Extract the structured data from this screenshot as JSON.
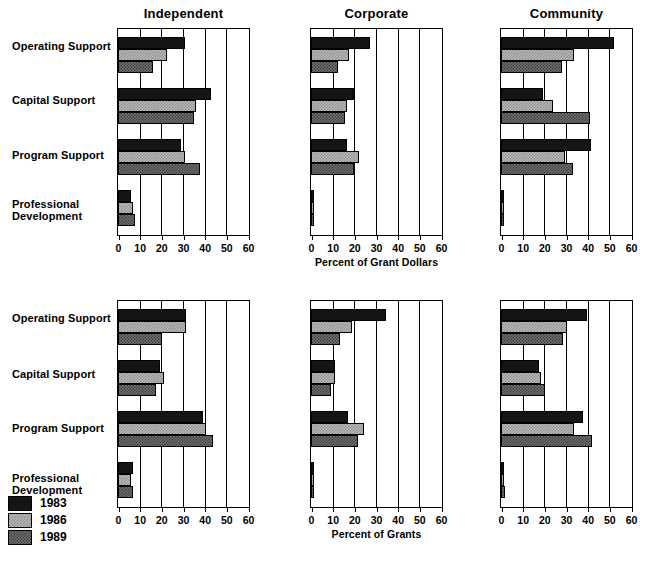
{
  "chart_data": {
    "type": "bar",
    "title": "",
    "orientation": "horizontal",
    "grid": true,
    "legend_position": "bottom-left",
    "xlim": [
      0,
      60
    ],
    "xticks": [
      0,
      10,
      20,
      30,
      40,
      50,
      60
    ],
    "categories": [
      "Operating Support",
      "Capital Support",
      "Program Support",
      "Professional Development"
    ],
    "series_names": [
      "1983",
      "1986",
      "1989"
    ],
    "series_colors": [
      "#151515",
      "#b8b8b8",
      "#6e6e6e"
    ],
    "panels": [
      {
        "title": "Independent",
        "xlabel": "",
        "row": "Percent of Grant Dollars",
        "series": [
          {
            "name": "1983",
            "values": [
              31,
              43,
              29,
              6
            ]
          },
          {
            "name": "1986",
            "values": [
              22.5,
              36,
              31,
              7
            ]
          },
          {
            "name": "1989",
            "values": [
              16,
              35,
              38,
              8
            ]
          }
        ]
      },
      {
        "title": "Corporate",
        "xlabel": "Percent of Grant Dollars",
        "row": "Percent of Grant Dollars",
        "series": [
          {
            "name": "1983",
            "values": [
              27,
              20,
              16.5,
              1
            ]
          },
          {
            "name": "1986",
            "values": [
              17.5,
              16.5,
              22,
              0.8
            ]
          },
          {
            "name": "1989",
            "values": [
              12.5,
              15.5,
              20,
              0.8
            ]
          }
        ]
      },
      {
        "title": "Community",
        "xlabel": "",
        "row": "Percent of Grant Dollars",
        "series": [
          {
            "name": "1983",
            "values": [
              52,
              19.5,
              41.5,
              1.5
            ]
          },
          {
            "name": "1986",
            "values": [
              33.5,
              24,
              29.5,
              1
            ]
          },
          {
            "name": "1989",
            "values": [
              28,
              41,
              33,
              0.6
            ]
          }
        ]
      },
      {
        "title": "",
        "xlabel": "",
        "row": "Percent of Grants",
        "series": [
          {
            "name": "1983",
            "values": [
              31.5,
              19.5,
              39,
              7
            ]
          },
          {
            "name": "1986",
            "values": [
              31.5,
              21,
              40.5,
              6
            ]
          },
          {
            "name": "1989",
            "values": [
              20.5,
              17.5,
              44,
              7
            ]
          }
        ]
      },
      {
        "title": "",
        "xlabel": "Percent of Grants",
        "row": "Percent of Grants",
        "series": [
          {
            "name": "1983",
            "values": [
              34.5,
              11,
              17,
              1
            ]
          },
          {
            "name": "1986",
            "values": [
              19,
              11,
              24.5,
              0.8
            ]
          },
          {
            "name": "1989",
            "values": [
              13.5,
              9,
              21.5,
              0.8
            ]
          }
        ]
      },
      {
        "title": "",
        "xlabel": "",
        "row": "Percent of Grants",
        "series": [
          {
            "name": "1983",
            "values": [
              39.5,
              17.5,
              38,
              1.5
            ]
          },
          {
            "name": "1986",
            "values": [
              30.5,
              18.5,
              33.5,
              1.5
            ]
          },
          {
            "name": "1989",
            "values": [
              28.5,
              20.5,
              42,
              2
            ]
          }
        ]
      }
    ]
  },
  "top_row": {
    "panels": [
      {
        "title": "Independent"
      },
      {
        "title": "Corporate"
      },
      {
        "title": "Community"
      }
    ],
    "axis_title": "Percent of Grant Dollars",
    "categories": [
      "Operating Support",
      "Capital Support",
      "Program Support",
      "Professional\nDevelopment"
    ],
    "cat1": "Operating Support",
    "cat2": "Capital Support",
    "cat3": "Program Support",
    "cat4a": "Professional",
    "cat4b": "Development",
    "xticks": [
      "0",
      "10",
      "20",
      "30",
      "40",
      "50",
      "60"
    ]
  },
  "bottom_row": {
    "axis_title": "Percent of Grants",
    "cat1": "Operating Support",
    "cat2": "Capital Support",
    "cat3": "Program Support",
    "cat4a": "Professional",
    "cat4b": "Development",
    "xticks": [
      "0",
      "10",
      "20",
      "30",
      "40",
      "50",
      "60"
    ]
  },
  "legend": {
    "items": [
      {
        "label": "1983",
        "color": "#151515"
      },
      {
        "label": "1986",
        "color": "#b8b8b8"
      },
      {
        "label": "1989",
        "color": "#6e6e6e"
      }
    ],
    "item0": "1983",
    "item1": "1986",
    "item2": "1989"
  }
}
